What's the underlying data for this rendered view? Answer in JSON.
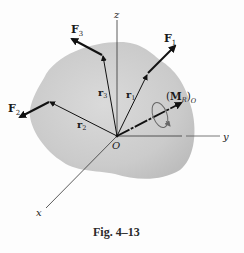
{
  "figure": {
    "caption": "Fig. 4–13",
    "axes": {
      "x": "x",
      "y": "y",
      "z": "z"
    },
    "origin": "O",
    "forces": [
      {
        "name": "F",
        "sub": "1"
      },
      {
        "name": "F",
        "sub": "2"
      },
      {
        "name": "F",
        "sub": "3"
      }
    ],
    "position_vectors": [
      {
        "name": "r",
        "sub": "1"
      },
      {
        "name": "r",
        "sub": "2"
      },
      {
        "name": "r",
        "sub": "3"
      }
    ],
    "moment": {
      "paren_open": "(",
      "name": "M",
      "sub_inner": "R",
      "paren_close": ")",
      "sub_outer": "O"
    },
    "colors": {
      "body": "#c9c9c9",
      "body_edge": "#b5b5b5",
      "vector": "#111111",
      "axis": "#333333"
    }
  }
}
